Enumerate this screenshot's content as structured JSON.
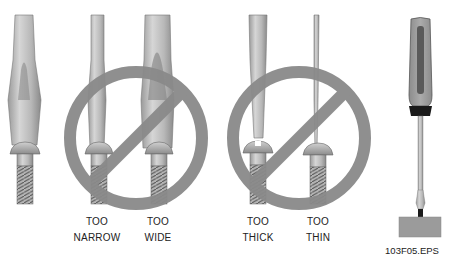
{
  "figure": {
    "id_label": "103F05.EPS",
    "colors": {
      "prohibit_sign": "#8a8a8a",
      "metal_light": "#cfcfcf",
      "metal_dark": "#7a7a7a",
      "handle": "#9a9a9a",
      "handle_groove": "#555555",
      "ferrule": "#1a1a1a",
      "block": "#9b9b9b"
    },
    "panels": [
      {
        "name": "correct-fit",
        "label_line1": "",
        "label_line2": "",
        "prohibited": false
      },
      {
        "name": "too-narrow",
        "label_line1": "TOO",
        "label_line2": "NARROW",
        "prohibited": true
      },
      {
        "name": "too-wide",
        "label_line1": "TOO",
        "label_line2": "WIDE",
        "prohibited": true
      },
      {
        "name": "too-thick",
        "label_line1": "TOO",
        "label_line2": "THICK",
        "prohibited": true
      },
      {
        "name": "too-thin",
        "label_line1": "TOO",
        "label_line2": "THIN",
        "prohibited": true
      },
      {
        "name": "screwdriver-in-use",
        "label_line1": "",
        "label_line2": "",
        "prohibited": false
      }
    ]
  }
}
